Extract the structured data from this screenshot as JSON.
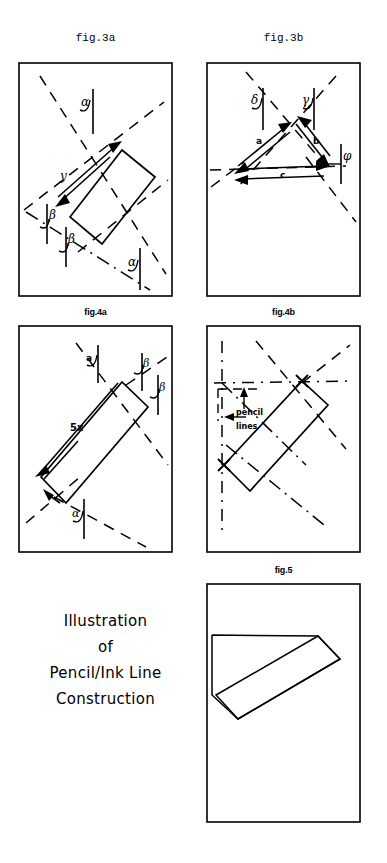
{
  "page": {
    "width": 387,
    "height": 863,
    "background": "#ffffff",
    "ink": "#000000"
  },
  "figures": [
    {
      "id": "fig3a",
      "caption": "fig.3a",
      "caption_style": "mono",
      "frame": {
        "x": 18,
        "y": 62,
        "w": 155,
        "h": 235
      },
      "labels": [
        {
          "text": "α",
          "name": "alpha-label-top"
        },
        {
          "text": "α",
          "name": "alpha-label-bottom"
        },
        {
          "text": "β",
          "name": "beta-label-upper"
        },
        {
          "text": "β",
          "name": "beta-label-lower"
        },
        {
          "text": "y",
          "name": "y-length-label"
        }
      ]
    },
    {
      "id": "fig3b",
      "caption": "fig.3b",
      "caption_style": "mono",
      "frame": {
        "x": 206,
        "y": 62,
        "w": 155,
        "h": 235
      },
      "labels": [
        {
          "text": "δ",
          "name": "delta-label"
        },
        {
          "text": "γ",
          "name": "gamma-label"
        },
        {
          "text": "φ",
          "name": "phi-label"
        },
        {
          "text": "a",
          "name": "side-a-label"
        },
        {
          "text": "b",
          "name": "side-b-label"
        },
        {
          "text": "c",
          "name": "side-c-label"
        }
      ]
    },
    {
      "id": "fig4a",
      "caption": "fig.4a",
      "caption_style": "bold",
      "frame": {
        "x": 18,
        "y": 325,
        "w": 155,
        "h": 228
      },
      "labels": [
        {
          "text": "a",
          "name": "a-label-top"
        },
        {
          "text": "β",
          "name": "beta-label-upper-right"
        },
        {
          "text": "β",
          "name": "beta-label-lower-right"
        },
        {
          "text": "5x",
          "name": "five-x-length-label"
        },
        {
          "text": "α",
          "name": "alpha-label-bottom"
        }
      ]
    },
    {
      "id": "fig4b",
      "caption": "fig.4b",
      "caption_style": "bold",
      "frame": {
        "x": 206,
        "y": 325,
        "w": 155,
        "h": 228
      },
      "labels": [
        {
          "text": "pencil",
          "name": "pencil-annotation-line1"
        },
        {
          "text": "lines",
          "name": "pencil-annotation-line2"
        }
      ]
    },
    {
      "id": "fig5",
      "caption": "fig.5",
      "caption_style": "bold",
      "frame": {
        "x": 206,
        "y": 583,
        "w": 155,
        "h": 240
      },
      "labels": []
    }
  ],
  "illustration_caption": {
    "line1": "Illustration",
    "line2": "of",
    "line3": "Pencil/Ink Line",
    "line4": "Construction"
  }
}
